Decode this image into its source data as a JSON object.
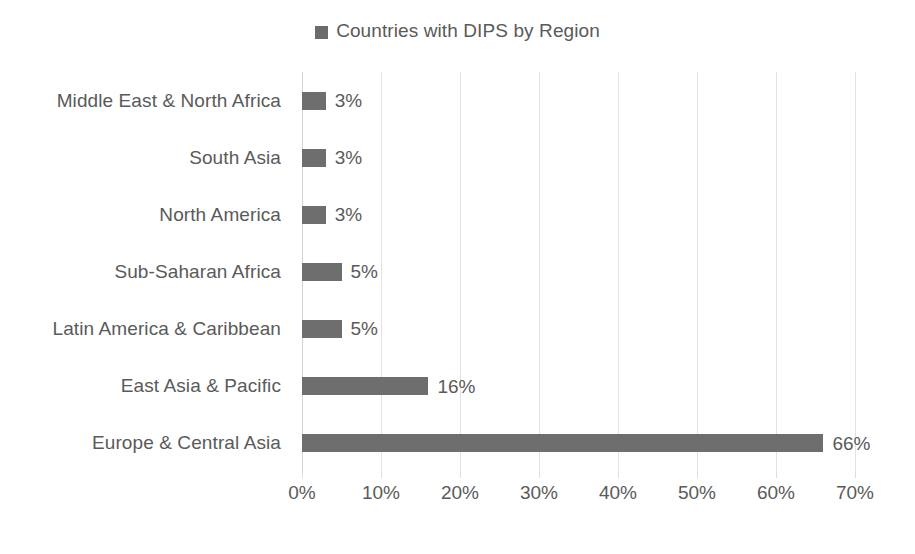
{
  "chart_data": {
    "type": "bar",
    "orientation": "horizontal",
    "title": "",
    "legend": {
      "position": "top-center",
      "entries": [
        "Countries with DIPS by Region"
      ]
    },
    "series_name": "Countries with DIPS by Region",
    "categories": [
      "Middle East & North Africa",
      "South Asia",
      "North America",
      "Sub-Saharan Africa",
      "Latin America & Caribbean",
      "East Asia & Pacific",
      "Europe & Central Asia"
    ],
    "values": [
      3,
      3,
      3,
      5,
      5,
      16,
      66
    ],
    "data_labels": [
      "3%",
      "3%",
      "3%",
      "5%",
      "5%",
      "16%",
      "66%"
    ],
    "xlabel": "",
    "ylabel": "",
    "xlim": [
      0,
      70
    ],
    "xtick_values": [
      0,
      10,
      20,
      30,
      40,
      50,
      60,
      70
    ],
    "xtick_labels": [
      "0%",
      "10%",
      "20%",
      "30%",
      "40%",
      "50%",
      "60%",
      "70%"
    ],
    "grid": {
      "vertical": true,
      "horizontal": false
    },
    "colors": {
      "bar": "#6e6e6e",
      "legend_swatch": "#6b6b6b",
      "text": "#5a5a5a",
      "gridline": "#e2e2e2",
      "background": "#ffffff"
    }
  }
}
